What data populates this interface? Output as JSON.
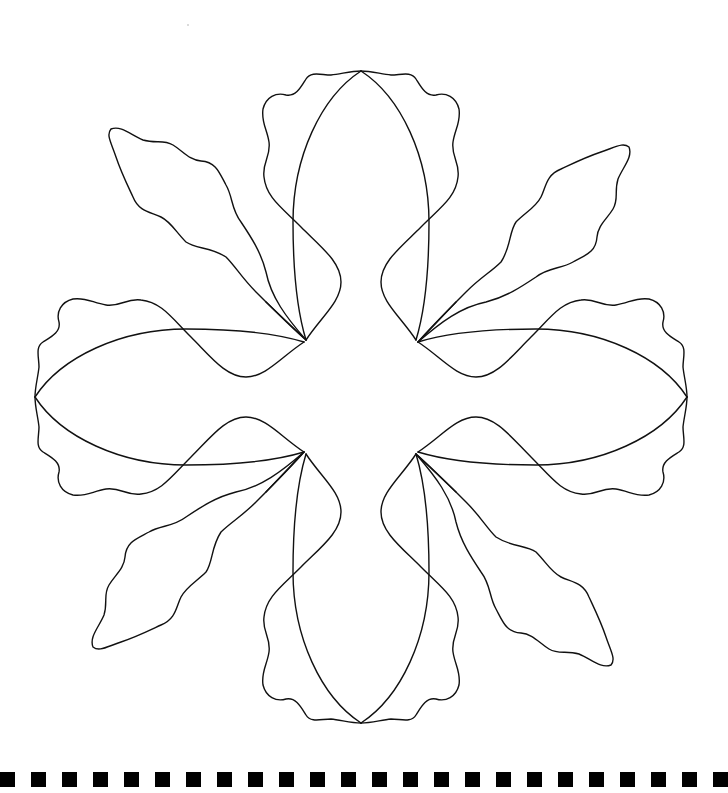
{
  "figure": {
    "background": "#ffffff",
    "line_color": "#111111",
    "center": [
      361,
      397
    ],
    "motif": {
      "petals": 4,
      "leaves": 4,
      "symmetry": "4-fold rotational",
      "petal_tips": [
        [
          361,
          71
        ],
        [
          52,
          392
        ],
        [
          670,
          397
        ],
        [
          361,
          722
        ]
      ],
      "junctions": [
        [
          306,
          340
        ],
        [
          416,
          340
        ],
        [
          306,
          452
        ],
        [
          416,
          452
        ]
      ]
    }
  },
  "border": {
    "type": "dashed-square-row",
    "color": "#000000",
    "count": 24,
    "square_size": 15,
    "period": 31,
    "y": 772
  }
}
